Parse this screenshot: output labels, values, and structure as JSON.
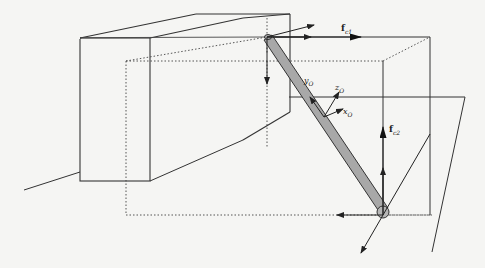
{
  "diagram": {
    "colors": {
      "background": "#f5f5f3",
      "line": "#333333",
      "rod_fill": "#a8a8a8",
      "dotted": "#444444"
    },
    "labels": {
      "f_c1": {
        "main": "f",
        "sub": "c1"
      },
      "f_c2": {
        "main": "f",
        "sub": "c2"
      },
      "y_O": {
        "main": "y",
        "sub": "O"
      },
      "z_O": {
        "main": "z",
        "sub": "O"
      },
      "x_O": {
        "main": "x",
        "sub": "O"
      }
    }
  }
}
